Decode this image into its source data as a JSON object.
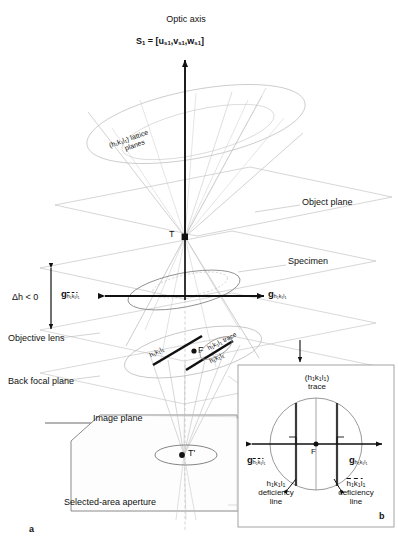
{
  "figure": {
    "title_top": "Optic axis",
    "beam_vector": {
      "symbol": "S",
      "sub": "1",
      "equals": "= [u",
      "v": "v",
      "w": "w",
      "sub_idx": "s1",
      "full": "S₁ = [u_s1,v_s1,w_s1]"
    },
    "panel_a_label": "a",
    "panel_b_label": "b"
  },
  "labels": {
    "optic_axis": "Optic axis",
    "lattice_planes_line1": "(h₁k₁l₁) lattice",
    "lattice_planes_line2": "planes",
    "object_plane": "Object plane",
    "specimen": "Specimen",
    "delta_h": "Δh < 0",
    "objective_lens": "Objective lens",
    "back_focal_plane": "Back focal plane",
    "image_plane": "Image plane",
    "selected_area_aperture": "Selected-area aperture",
    "point_T": "T",
    "point_T_prime": "T'",
    "point_F": "F",
    "hkl_trace": "h₁k₁l₁ trace",
    "hkl_plain": "h₁k₁l₁",
    "hkl_bar": "h̄₁k̄₁l̄₁"
  },
  "g_vectors": {
    "left_main": {
      "g": "g",
      "sub": "h̄₁k̄₁l̄₁"
    },
    "right_main": {
      "g": "g",
      "sub": "h₁k₁l₁"
    },
    "left_inset": {
      "g": "g",
      "sub": "h̄₁k̄₁l̄₁"
    },
    "right_inset": {
      "g": "g",
      "sub": "h₁k₁l₁"
    }
  },
  "inset": {
    "trace_line1": "(h₁k₁l₁)",
    "trace_line2": "trace",
    "focal_point": "F",
    "left_def_line1": "h₁k₁l₁",
    "left_def_line2": "deficiency",
    "left_def_line3": "line",
    "right_def_line1": "h̄₁k̄₁l̄₁",
    "right_def_line2": "deficiency",
    "right_def_line3": "line"
  },
  "colors": {
    "ink": "#111111",
    "construction": "#b9b9b9",
    "faint": "#cfcfcf",
    "mid": "#8d8d8d",
    "background": "#ffffff"
  }
}
